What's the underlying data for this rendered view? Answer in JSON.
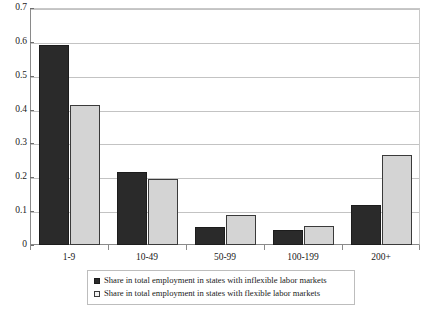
{
  "chart_data": {
    "type": "bar",
    "title": "",
    "xlabel": "",
    "ylabel": "",
    "categories": [
      "1-9",
      "10-49",
      "50-99",
      "100-199",
      "200+"
    ],
    "series": [
      {
        "name": "Share in total employment in states with inflexible labor markets",
        "color": "#2a2a2a",
        "values": [
          0.59,
          0.215,
          0.052,
          0.045,
          0.117
        ]
      },
      {
        "name": "Share in total employment in states with flexible labor markets",
        "color": "#d4d4d4",
        "values": [
          0.415,
          0.195,
          0.09,
          0.055,
          0.265
        ]
      }
    ],
    "ylim": [
      0,
      0.7
    ],
    "ytick_labels": [
      "0",
      "0.1",
      "0.2",
      "0.3",
      "0.4",
      "0.5",
      "0.6",
      "0.7"
    ],
    "ytick_values": [
      0,
      0.1,
      0.2,
      0.3,
      0.4,
      0.5,
      0.6,
      0.7
    ],
    "grid": true,
    "legend_position": "bottom"
  },
  "legend": {
    "items": [
      {
        "label": "Share in total employment in states with inflexible labor markets",
        "swatch": "dark"
      },
      {
        "label": "Share in total employment in states with flexible labor markets",
        "swatch": "light"
      }
    ]
  }
}
